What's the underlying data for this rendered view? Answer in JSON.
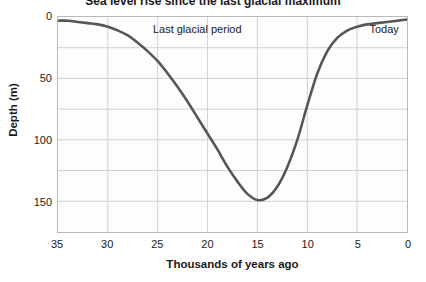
{
  "chart_data": {
    "type": "line",
    "title": "Sea level rise since the last glacial maximum",
    "xlabel": "Thousands of years ago",
    "ylabel": "Depth (m)",
    "xlim": [
      35,
      0
    ],
    "ylim": [
      175,
      0
    ],
    "x_ticks": [
      "35",
      "30",
      "25",
      "20",
      "15",
      "10",
      "5",
      "0"
    ],
    "x_tick_values": [
      35,
      30,
      25,
      20,
      15,
      10,
      5,
      0
    ],
    "y_ticks": [
      "0",
      "50",
      "100",
      "150"
    ],
    "y_tick_values": [
      0,
      50,
      100,
      150
    ],
    "grid": true,
    "grid_x_step": 5,
    "grid_y_step": 25,
    "legend": "none",
    "line_color": "#565656",
    "line_width": 2.6,
    "x_inverted": true,
    "y_inverted": true,
    "annotations": [
      {
        "text": "Last glacial period",
        "x": 21.0,
        "y": 11
      },
      {
        "text": "Today",
        "x": 2.4,
        "y": 11
      }
    ],
    "series": [
      {
        "name": "Relative sea level (depth below present)",
        "x": [
          35,
          34,
          33,
          32,
          31,
          30,
          29,
          28,
          27,
          26,
          25,
          24,
          23,
          22,
          21,
          20,
          19,
          18,
          17,
          16,
          15,
          14,
          13,
          12,
          11,
          10,
          9,
          8,
          7,
          6,
          5,
          4,
          3,
          2,
          1,
          0
        ],
        "values": [
          3,
          3,
          4,
          5,
          6,
          8,
          11,
          15,
          21,
          28,
          36,
          46,
          57,
          69,
          82,
          95,
          108,
          122,
          134,
          144,
          149,
          147,
          138,
          122,
          100,
          72,
          46,
          28,
          17,
          11,
          8,
          6,
          5,
          4,
          3,
          2
        ]
      }
    ]
  }
}
